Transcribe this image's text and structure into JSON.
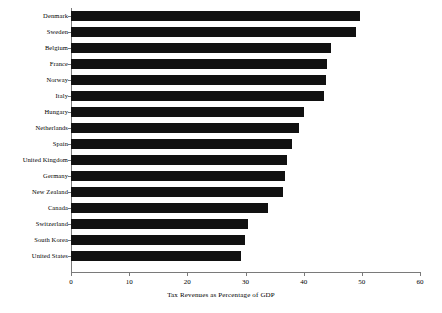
{
  "chart_data": {
    "type": "bar",
    "orientation": "horizontal",
    "title": "",
    "xlabel": "Tax Revenues as Percentage of GDP",
    "ylabel": "",
    "categories": [
      "Denmark",
      "Sweden",
      "Belgium",
      "France",
      "Norway",
      "Italy",
      "Hungary",
      "Netherlands",
      "Spain",
      "United Kingdom",
      "Germany",
      "New Zealand",
      "Canada",
      "Switzerland",
      "South Korea",
      "United States"
    ],
    "values": [
      49.6,
      49.0,
      44.7,
      44.0,
      43.8,
      43.5,
      40.0,
      39.2,
      38.0,
      37.2,
      36.8,
      36.4,
      33.9,
      30.5,
      29.9,
      29.2
    ],
    "xlim": [
      0,
      60
    ],
    "xticks": [
      0,
      10,
      20,
      30,
      40,
      50,
      60
    ],
    "xtick_labels": [
      "0",
      "10",
      "20",
      "30",
      "40",
      "50",
      "60"
    ],
    "grid": false,
    "legend": null,
    "bar_color": "#111111",
    "axis_color": "#7a7a7a"
  }
}
